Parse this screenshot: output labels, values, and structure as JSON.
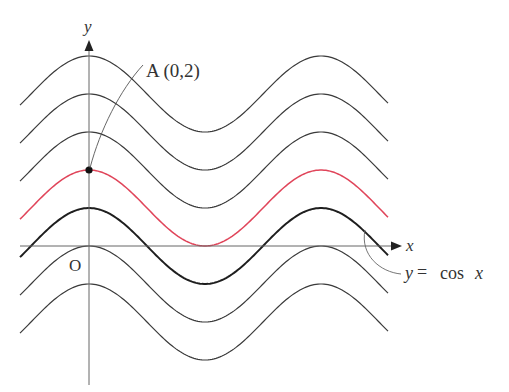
{
  "figure": {
    "axis_labels": {
      "x": "x",
      "y": "y",
      "origin": "O"
    },
    "point_label": "A (0,2)",
    "curve_label": {
      "y": "y",
      "eq": "=",
      "fn": "cos",
      "x": "x"
    },
    "colors": {
      "curve": "#3a3a3a",
      "highlight": "#e0455a",
      "base": "#1e1e1e",
      "axis": "#555555"
    }
  },
  "chart_data": {
    "type": "line",
    "title": "",
    "xlabel": "x",
    "ylabel": "y",
    "series": [
      {
        "name": "y=cos x + 4",
        "shift": 4,
        "style": "thin"
      },
      {
        "name": "y=cos x + 3",
        "shift": 3,
        "style": "thin"
      },
      {
        "name": "y=cos x + 2",
        "shift": 2,
        "style": "thin"
      },
      {
        "name": "y=cos x + 1",
        "shift": 1,
        "style": "highlight-red"
      },
      {
        "name": "y=cos x",
        "shift": 0,
        "style": "thick"
      },
      {
        "name": "y=cos x - 1",
        "shift": -1,
        "style": "thin"
      },
      {
        "name": "y=cos x - 2",
        "shift": -2,
        "style": "thin"
      }
    ],
    "annotations": [
      {
        "label": "A(0,2)",
        "x": 0,
        "y": 2
      },
      {
        "label": "y=cos x",
        "target": "base curve"
      },
      {
        "label": "O",
        "x": 0,
        "y": 0
      }
    ],
    "x_range_approx": [
      -0.6,
      2.6
    ],
    "x_range_units": "multiples of pi",
    "grid": false
  }
}
